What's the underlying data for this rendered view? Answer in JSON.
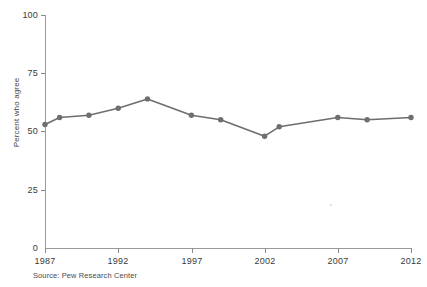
{
  "chart_data": {
    "type": "line",
    "title": "",
    "xlabel": "",
    "ylabel": "Percent who agree",
    "ylim": [
      0,
      100
    ],
    "xlim": [
      1987,
      2012
    ],
    "yticks": [
      0,
      25,
      50,
      75,
      100
    ],
    "xticks": [
      1987,
      1992,
      1997,
      2002,
      2007,
      2012
    ],
    "grid": false,
    "legend": null,
    "series": [
      {
        "name": "Percent who agree",
        "color": "#6e6e6e",
        "marker": "circle",
        "x": [
          1987,
          1988,
          1990,
          1992,
          1994,
          1997,
          1999,
          2002,
          2003,
          2007,
          2009,
          2012
        ],
        "values": [
          53,
          56,
          57,
          60,
          64,
          57,
          55,
          48,
          52,
          56,
          55,
          56
        ]
      }
    ]
  },
  "chart": {
    "cut_off_header": "",
    "y_axis_label": "Percent who agree",
    "y_tick_labels": [
      "100",
      "75",
      "50",
      "25",
      "0"
    ],
    "x_tick_labels": [
      "1987",
      "1992",
      "1997",
      "2002",
      "2007",
      "2012"
    ],
    "source_note": "Source: Pew Research Center",
    "line_color": "#6e6e6e",
    "axis_color": "#9a9a9a",
    "text_color": "#3a3a3a"
  }
}
